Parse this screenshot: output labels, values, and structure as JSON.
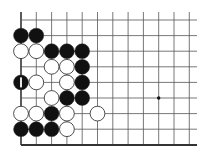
{
  "board": {
    "description": "Go board diagram, partial view (lower-left corner region)",
    "colors": {
      "background": "#ffffff",
      "line": "#555555",
      "edge": "#333333",
      "black_stone": "#111111",
      "white_stone": "#ffffff",
      "stone_outline": "#222222",
      "mark": "#ffffff"
    },
    "geometry": {
      "col_x": [
        21,
        36.3,
        51.6,
        66.9,
        82.2,
        97.5,
        112.8,
        128.1,
        143.4,
        158.7,
        174,
        189.3
      ],
      "row_y": [
        20,
        35.6,
        51.2,
        66.8,
        82.4,
        98,
        113.6,
        129.2,
        145
      ],
      "top_open_to": 12,
      "right_open_to": 197,
      "stone_radius": 7.4,
      "left_edge": true,
      "bottom_edge": true
    },
    "star_points": [
      {
        "col": 9,
        "row": 5
      }
    ],
    "stones": [
      {
        "col": 0,
        "row": 1,
        "color": "black"
      },
      {
        "col": 1,
        "row": 1,
        "color": "black"
      },
      {
        "col": 0,
        "row": 2,
        "color": "white"
      },
      {
        "col": 1,
        "row": 2,
        "color": "white"
      },
      {
        "col": 2,
        "row": 2,
        "color": "black"
      },
      {
        "col": 3,
        "row": 2,
        "color": "black"
      },
      {
        "col": 4,
        "row": 2,
        "color": "black"
      },
      {
        "col": 2,
        "row": 3,
        "color": "white"
      },
      {
        "col": 3,
        "row": 3,
        "color": "white"
      },
      {
        "col": 4,
        "row": 3,
        "color": "black"
      },
      {
        "col": 0,
        "row": 4,
        "color": "black",
        "mark": "bar"
      },
      {
        "col": 1,
        "row": 4,
        "color": "white"
      },
      {
        "col": 3,
        "row": 4,
        "color": "white"
      },
      {
        "col": 4,
        "row": 4,
        "color": "black"
      },
      {
        "col": 2,
        "row": 5,
        "color": "white"
      },
      {
        "col": 3,
        "row": 5,
        "color": "black"
      },
      {
        "col": 4,
        "row": 5,
        "color": "black"
      },
      {
        "col": 0,
        "row": 6,
        "color": "white"
      },
      {
        "col": 1,
        "row": 6,
        "color": "white"
      },
      {
        "col": 2,
        "row": 6,
        "color": "black"
      },
      {
        "col": 3,
        "row": 6,
        "color": "white"
      },
      {
        "col": 5,
        "row": 6,
        "color": "white"
      },
      {
        "col": 0,
        "row": 7,
        "color": "black"
      },
      {
        "col": 1,
        "row": 7,
        "color": "black"
      },
      {
        "col": 2,
        "row": 7,
        "color": "black"
      },
      {
        "col": 3,
        "row": 7,
        "color": "white"
      }
    ]
  }
}
